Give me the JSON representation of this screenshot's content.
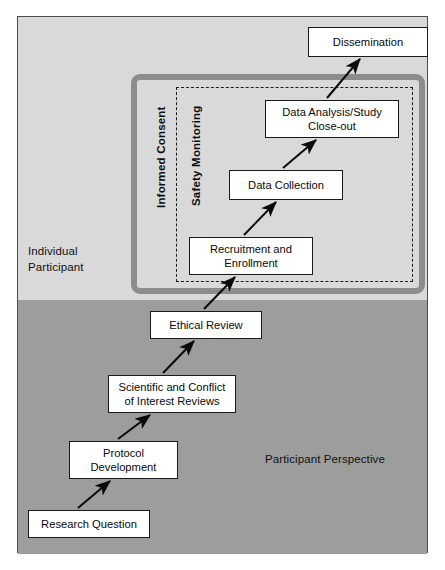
{
  "figure": {
    "regions": [
      {
        "id": "individual-participant",
        "label": "Individual\nParticipant"
      },
      {
        "id": "participant-perspective",
        "label": "Participant Perspective"
      }
    ],
    "enclosures": [
      {
        "id": "informed-consent",
        "label": "Informed Consent",
        "style": "thick-gray-rounded-border",
        "color": "#8c8c8c"
      },
      {
        "id": "safety-monitoring",
        "label": "Safety Monitoring",
        "style": "dashed-border",
        "color": "#1c1c1c"
      }
    ],
    "nodes": [
      {
        "id": "research-question",
        "label": "Research Question"
      },
      {
        "id": "protocol-development",
        "label": "Protocol\nDevelopment"
      },
      {
        "id": "scientific-conflict",
        "label": "Scientific and Conflict\nof Interest Reviews"
      },
      {
        "id": "ethical-review",
        "label": "Ethical Review"
      },
      {
        "id": "recruitment",
        "label": "Recruitment and\nEnrollment"
      },
      {
        "id": "data-collection",
        "label": "Data Collection"
      },
      {
        "id": "data-analysis",
        "label": "Data Analysis/Study\nClose-out"
      },
      {
        "id": "dissemination",
        "label": "Dissemination"
      }
    ],
    "arrows": [
      {
        "from": "research-question",
        "to": "protocol-development"
      },
      {
        "from": "protocol-development",
        "to": "scientific-conflict"
      },
      {
        "from": "scientific-conflict",
        "to": "ethical-review"
      },
      {
        "from": "ethical-review",
        "to": "recruitment"
      },
      {
        "from": "recruitment",
        "to": "data-collection"
      },
      {
        "from": "data-collection",
        "to": "data-analysis"
      },
      {
        "from": "data-analysis",
        "to": "dissemination"
      }
    ],
    "colors": {
      "band_top": "#d9d9d9",
      "band_bottom": "#9d9d9d",
      "node_fill": "#ffffff",
      "node_border": "#1a1a1a",
      "frame_border": "#4d4d4d"
    }
  }
}
